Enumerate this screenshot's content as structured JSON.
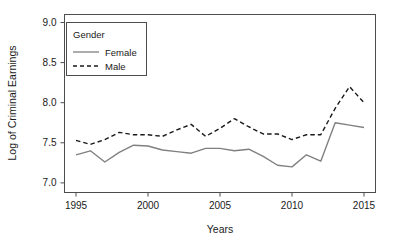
{
  "chart_data": {
    "type": "line",
    "title": "",
    "xlabel": "Years",
    "ylabel": "Log of Criminal Earnings",
    "x": [
      1995,
      1996,
      1997,
      1998,
      1999,
      2000,
      2001,
      2002,
      2003,
      2004,
      2005,
      2006,
      2007,
      2008,
      2009,
      2010,
      2011,
      2012,
      2013,
      2014,
      2015
    ],
    "xlim": [
      1994.2,
      2015.8
    ],
    "ylim": [
      6.88,
      9.1
    ],
    "xticks": [
      1995,
      2000,
      2005,
      2010,
      2015
    ],
    "xtick_labels": [
      "1995",
      "2000",
      "2005",
      "2010",
      "2015"
    ],
    "yticks": [
      7.0,
      7.5,
      8.0,
      8.5,
      9.0
    ],
    "ytick_labels": [
      "7.0",
      "7.5",
      "8.0",
      "8.5",
      "9.0"
    ],
    "grid": false,
    "legend_position": "top-left",
    "legend_title": "Gender",
    "series": [
      {
        "name": "Female",
        "style": "solid",
        "color": "#808080",
        "values": [
          7.35,
          7.4,
          7.26,
          7.38,
          7.47,
          7.46,
          7.41,
          7.39,
          7.37,
          7.43,
          7.43,
          7.4,
          7.42,
          7.33,
          7.22,
          7.2,
          7.35,
          7.27,
          7.75,
          7.72,
          7.69
        ]
      },
      {
        "name": "Male",
        "style": "dashed",
        "color": "#1a1a1a",
        "values": [
          7.53,
          7.48,
          7.54,
          7.63,
          7.6,
          7.6,
          7.58,
          7.66,
          7.73,
          7.58,
          7.68,
          7.8,
          7.7,
          7.61,
          7.61,
          7.54,
          7.6,
          7.6,
          7.93,
          8.2,
          8.0
        ]
      }
    ]
  },
  "legend": {
    "title": "Gender",
    "entries": [
      {
        "label": "Female"
      },
      {
        "label": "Male"
      }
    ]
  },
  "axes": {
    "x_title": "Years",
    "y_title": "Log of Criminal Earnings"
  }
}
